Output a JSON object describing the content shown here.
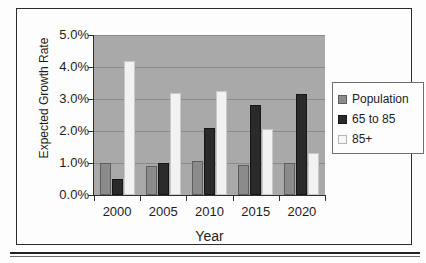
{
  "chart_data": {
    "type": "bar",
    "title": "",
    "xlabel": "Year",
    "ylabel": "Expected Growth Rate",
    "categories": [
      "2000",
      "2005",
      "2010",
      "2015",
      "2020"
    ],
    "series": [
      {
        "name": "Population",
        "color": "#8b8b8b",
        "values": [
          1.0,
          0.9,
          1.05,
          0.95,
          1.0
        ]
      },
      {
        "name": "65 to 85",
        "color": "#2a2a2a",
        "values": [
          0.5,
          1.0,
          2.1,
          2.8,
          3.15
        ]
      },
      {
        "name": "85+",
        "color": "#f2f2f2",
        "values": [
          4.2,
          3.2,
          3.25,
          2.05,
          1.3
        ]
      }
    ],
    "ylim": [
      0.0,
      5.0
    ],
    "ytick_labels": [
      "0.0%",
      "1.0%",
      "2.0%",
      "3.0%",
      "4.0%",
      "5.0%"
    ],
    "ytick_values": [
      0.0,
      1.0,
      2.0,
      3.0,
      4.0,
      5.0
    ],
    "grid": true,
    "legend_position": "right",
    "plot_background": "#a9a9a9",
    "gridline_color": "#8a8a8a"
  },
  "legend": {
    "entries": [
      {
        "label": "Population",
        "swatch": "population"
      },
      {
        "label": "65 to 85",
        "swatch": "older"
      },
      {
        "label": "85+",
        "swatch": "oldest"
      }
    ]
  }
}
